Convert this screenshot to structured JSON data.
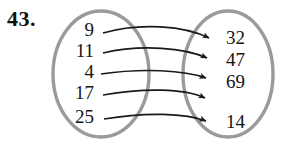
{
  "problem": {
    "number": "43."
  },
  "figure": {
    "type": "mapping-diagram",
    "domain_label": "",
    "codomain_label": "",
    "domain_elements": [
      "9",
      "11",
      "4",
      "17",
      "25"
    ],
    "codomain_elements": [
      "32",
      "47",
      "69",
      "14"
    ],
    "mappings": [
      {
        "from": "9",
        "to": "32"
      },
      {
        "from": "11",
        "to": "47"
      },
      {
        "from": "4",
        "to": "47"
      },
      {
        "from": "17",
        "to": "69"
      },
      {
        "from": "25",
        "to": "14"
      }
    ],
    "colors": {
      "oval_stroke": "#9a9a9a",
      "arrow": "#1a1a1a",
      "text": "#141414",
      "number_label": "#111111",
      "background": "#ffffff"
    }
  },
  "geometry": {
    "left_oval": {
      "cx": 101,
      "cy": 74,
      "rx": 48,
      "ry": 63
    },
    "right_oval": {
      "cx": 228,
      "cy": 74,
      "rx": 45,
      "ry": 63
    },
    "domain_positions_y": [
      36,
      56,
      75,
      96,
      120
    ],
    "codomain_positions_y": [
      40,
      61,
      82,
      101,
      124
    ],
    "domain_text_x": 94,
    "codomain_text_x": 226
  }
}
